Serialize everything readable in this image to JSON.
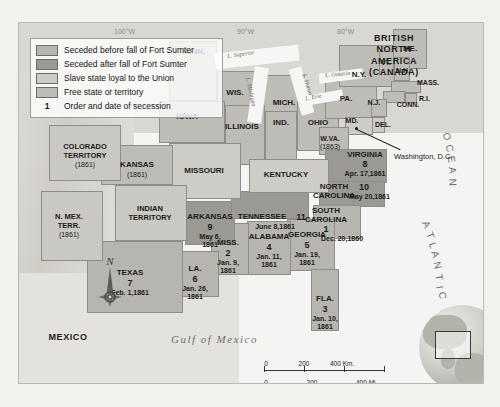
{
  "map": {
    "title": "Secession of the Southern States",
    "legend": {
      "items": [
        {
          "key": "swatch",
          "fill": "#b6b5b0",
          "label": "Seceded before fall of Fort Sumter"
        },
        {
          "key": "swatch",
          "fill": "#9a9994",
          "label": "Seceded after fall of Fort Sumter"
        },
        {
          "key": "swatch",
          "fill": "#cdccc7",
          "label": "Slave state loyal to the Union"
        },
        {
          "key": "swatch",
          "fill": "#bdbcb7",
          "label": "Free state or territory"
        },
        {
          "key": "1",
          "fill": null,
          "label": "Order and date of secession"
        }
      ]
    },
    "regions": [
      {
        "name": "BRITISH NORTH AMERICA (CANADA)"
      },
      {
        "name": "MEXICO"
      }
    ],
    "water_labels": [
      {
        "name": "Gulf of Mexico"
      },
      {
        "name": "ATLANTIC OCEAN"
      },
      {
        "name": "L. Superior"
      },
      {
        "name": "L. Michigan"
      },
      {
        "name": "L. Huron"
      },
      {
        "name": "L. Ontario"
      },
      {
        "name": "L. Erie"
      }
    ],
    "longitude_labels": [
      "100°W",
      "90°W",
      "80°W"
    ],
    "cities": [
      {
        "name": "Washington, D.C."
      }
    ],
    "states": [
      {
        "name": "MINN.",
        "order": null,
        "date": null,
        "status": "free"
      },
      {
        "name": "WIS.",
        "order": null,
        "date": null,
        "status": "free"
      },
      {
        "name": "MICH.",
        "order": null,
        "date": null,
        "status": "free"
      },
      {
        "name": "IOWA",
        "order": null,
        "date": null,
        "status": "free"
      },
      {
        "name": "ILLINOIS",
        "order": null,
        "date": null,
        "status": "free"
      },
      {
        "name": "IND.",
        "order": null,
        "date": null,
        "status": "free"
      },
      {
        "name": "OHIO",
        "order": null,
        "date": null,
        "status": "free"
      },
      {
        "name": "PA.",
        "order": null,
        "date": null,
        "status": "free"
      },
      {
        "name": "N.Y.",
        "order": null,
        "date": null,
        "status": "free"
      },
      {
        "name": "ME.",
        "order": null,
        "date": null,
        "status": "free"
      },
      {
        "name": "VT.",
        "order": null,
        "date": null,
        "status": "free"
      },
      {
        "name": "N.H.",
        "order": null,
        "date": null,
        "status": "free"
      },
      {
        "name": "MASS.",
        "order": null,
        "date": null,
        "status": "free"
      },
      {
        "name": "R.I.",
        "order": null,
        "date": null,
        "status": "free"
      },
      {
        "name": "CONN.",
        "order": null,
        "date": null,
        "status": "free"
      },
      {
        "name": "N.J.",
        "order": null,
        "date": null,
        "status": "free"
      },
      {
        "name": "DEL.",
        "order": null,
        "date": null,
        "status": "slave-loyal"
      },
      {
        "name": "MD.",
        "order": null,
        "date": null,
        "status": "slave-loyal"
      },
      {
        "name": "W.VA.",
        "order": null,
        "date": "(1863)",
        "status": "free"
      },
      {
        "name": "VIRGINIA",
        "order": "8",
        "date": "Apr. 17,1861",
        "status": "after"
      },
      {
        "name": "NORTH CAROLINA",
        "order": "10",
        "date": "May 20,1861",
        "status": "after"
      },
      {
        "name": "SOUTH CAROLINA",
        "order": "1",
        "date": "Dec. 20,1860",
        "status": "before"
      },
      {
        "name": "GEORGIA",
        "order": "5",
        "date": "Jan. 19, 1861",
        "status": "before"
      },
      {
        "name": "FLA.",
        "order": "3",
        "date": "Jan. 10, 1861",
        "status": "before"
      },
      {
        "name": "ALABAMA",
        "order": "4",
        "date": "Jan. 11, 1861",
        "status": "before"
      },
      {
        "name": "MISS.",
        "order": "2",
        "date": "Jan. 9, 1861",
        "status": "before"
      },
      {
        "name": "LA.",
        "order": "6",
        "date": "Jan. 26, 1861",
        "status": "before"
      },
      {
        "name": "TEXAS",
        "order": "7",
        "date": "Feb. 1,1861",
        "status": "before"
      },
      {
        "name": "ARKANSAS",
        "order": "9",
        "date": "May 6, 1861",
        "status": "after"
      },
      {
        "name": "TENNESSEE",
        "order": "11",
        "date": "June 8,1861",
        "status": "after"
      },
      {
        "name": "KENTUCKY",
        "order": null,
        "date": null,
        "status": "slave-loyal"
      },
      {
        "name": "MISSOURI",
        "order": null,
        "date": null,
        "status": "slave-loyal"
      },
      {
        "name": "KANSAS",
        "order": null,
        "date": "(1861)",
        "status": "free"
      },
      {
        "name": "COLORADO TERRITORY",
        "order": null,
        "date": "(1861)",
        "status": "territory"
      },
      {
        "name": "N. MEX. TERR.",
        "order": null,
        "date": "(1861)",
        "status": "territory"
      },
      {
        "name": "INDIAN TERRITORY",
        "order": null,
        "date": null,
        "status": "territory"
      }
    ],
    "scale": {
      "km": {
        "ticks": [
          "0",
          "200",
          "400"
        ],
        "unit": "Km."
      },
      "mi": {
        "ticks": [
          "0",
          "200",
          "400"
        ],
        "unit": "Mi."
      }
    },
    "compass": {
      "north_label": "N"
    }
  },
  "state_labels": {
    "minn": "MINN.",
    "wis": "WIS.",
    "mich": "MICH.",
    "iowa": "IOWA",
    "illinois": "ILLINOIS",
    "ind": "IND.",
    "ohio": "OHIO",
    "pa": "PA.",
    "ny": "N.Y.",
    "me": "ME.",
    "vt": "VT.",
    "nh": "N.H.",
    "mass": "MASS.",
    "ri": "R.I.",
    "conn": "CONN.",
    "nj": "N.J.",
    "del": "DEL.",
    "md": "MD.",
    "wva": "W.VA.",
    "wva_date": "(1863)",
    "virginia": "VIRGINIA",
    "virginia_num": "8",
    "virginia_date": "Apr. 17,1861",
    "nc": "NORTH\nCAROLINA",
    "nc_num": "10",
    "nc_date": "May 20,1861",
    "sc": "SOUTH\nCAROLINA",
    "sc_num": "1",
    "sc_date": "Dec. 20,1860",
    "georgia": "GEORGIA",
    "georgia_num": "5",
    "georgia_date": "Jan. 19,\n1861",
    "fla": "FLA.",
    "fla_num": "3",
    "fla_date": "Jan. 10,\n1861",
    "alabama": "ALABAMA",
    "alabama_num": "4",
    "alabama_date": "Jan. 11,\n1861",
    "miss": "MISS.",
    "miss_num": "2",
    "miss_date": "Jan. 9,\n1861",
    "la": "LA.",
    "la_num": "6",
    "la_date": "Jan. 26,\n1861",
    "texas": "TEXAS",
    "texas_num": "7",
    "texas_date": "Feb. 1,1861",
    "arkansas": "ARKANSAS",
    "arkansas_num": "9",
    "arkansas_date": "May 6,\n1861",
    "tennessee": "TENNESSEE",
    "tennessee_num": "11",
    "tennessee_date": "June 8,1861",
    "kentucky": "KENTUCKY",
    "missouri": "MISSOURI",
    "kansas": "KANSAS",
    "kansas_date": "(1861)",
    "colorado": "COLORADO\nTERRITORY",
    "colorado_date": "(1861)",
    "nmex": "N. MEX.\nTERR.",
    "nmex_date": "(1861)",
    "indian": "INDIAN\nTERRITORY",
    "canada": "BRITISH\nNORTH\nAMERICA\n(CANADA)",
    "mexico": "MEXICO",
    "washington_dc": "Washington, D.C.",
    "gulf": "Gulf of Mexico",
    "lon_100": "100°W",
    "lon_90": "90°W",
    "lon_80": "80°W",
    "lake_superior": "L. Superior",
    "lake_michigan": "L. Michigan",
    "lake_huron": "L. Huron",
    "lake_ontario": "L. Ontario",
    "lake_erie": "L. Erie"
  },
  "scale_labels": {
    "km0": "0",
    "km200": "200",
    "km400": "400 Km.",
    "mi0": "0",
    "mi200": "200",
    "mi400": "400 Mi."
  },
  "compass_label": {
    "north": "N"
  }
}
